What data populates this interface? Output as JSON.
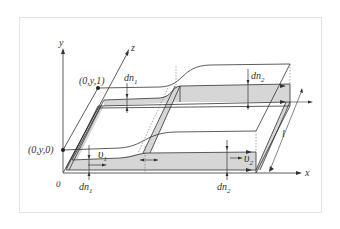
{
  "figure": {
    "type": "3d-schematic"
  },
  "axes": {
    "x": "x",
    "y": "y",
    "z": "z",
    "origin": "0"
  },
  "points": {
    "p_top": "(0,y,1)",
    "p_bottom": "(0,y,0)"
  },
  "labels": {
    "dn1_top": "dn",
    "dn1_top_sub": "1",
    "dn2_top": "dn",
    "dn2_top_sub": "2",
    "dn1_bottom": "dn",
    "dn1_bottom_sub": "1",
    "dn2_bottom": "dn",
    "dn2_bottom_sub": "2",
    "v1": "υ",
    "v1_sub": "1",
    "v2": "υ",
    "v2_sub": "2",
    "length": "l"
  },
  "colors": {
    "line": "#333333",
    "fill": "#d6d6d6",
    "frame": "#e4e4e4"
  }
}
